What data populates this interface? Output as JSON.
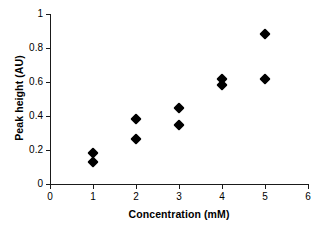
{
  "chart_data": {
    "type": "scatter",
    "title": "",
    "xlabel": "Concentration (mM)",
    "ylabel": "Peak height (AU)",
    "xlim": [
      0,
      6
    ],
    "ylim": [
      0,
      1
    ],
    "xticks": [
      "0",
      "1",
      "2",
      "3",
      "4",
      "5",
      "6"
    ],
    "yticks": [
      "0",
      "0.2",
      "0.4",
      "0.6",
      "0.8",
      "1"
    ],
    "xtick_values": [
      0,
      1,
      2,
      3,
      4,
      5,
      6
    ],
    "ytick_values": [
      0,
      0.2,
      0.4,
      0.6,
      0.8,
      1
    ],
    "grid": false,
    "legend": null,
    "marker": "filled-diamond",
    "marker_color": "#000000",
    "series": [
      {
        "name": "Peak height",
        "points": [
          {
            "x": 1,
            "y": 0.185
          },
          {
            "x": 1,
            "y": 0.13
          },
          {
            "x": 2,
            "y": 0.38
          },
          {
            "x": 2,
            "y": 0.265
          },
          {
            "x": 3,
            "y": 0.445
          },
          {
            "x": 3,
            "y": 0.35
          },
          {
            "x": 4,
            "y": 0.615
          },
          {
            "x": 4,
            "y": 0.58
          },
          {
            "x": 5,
            "y": 0.885
          },
          {
            "x": 5,
            "y": 0.615
          }
        ]
      }
    ]
  },
  "colors": {
    "axis": "#1a1a1a",
    "marker": "#000000",
    "background": "#ffffff"
  }
}
